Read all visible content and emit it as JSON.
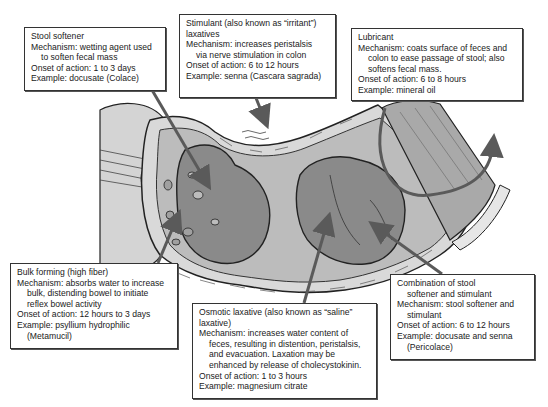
{
  "figure": {
    "colors": {
      "colon_wall": "#d9d9d9",
      "colon_lumen": "#bcbcbc",
      "stool_mass": "#8a8a8a",
      "arrow": "#5a5a5a",
      "box_border": "#333333",
      "box_bg": "#ffffff"
    }
  },
  "callouts": [
    {
      "id": "stool-softener",
      "title": "Stool softener",
      "lines": [
        "Stool softener",
        "Mechanism: wetting agent used",
        "to soften fecal mass",
        "Onset of action: 1 to 3 days",
        "Example: docusate (Colace)"
      ]
    },
    {
      "id": "stimulant",
      "title": "Stimulant (also known as “irritant”) laxatives",
      "lines": [
        "Stimulant (also known as “irritant”)",
        "laxatives",
        "Mechanism: increases peristalsis",
        "via nerve stimulation in colon",
        "Onset of action: 6 to 12 hours",
        "Example: senna (Cascara sagrada)"
      ]
    },
    {
      "id": "lubricant",
      "title": "Lubricant",
      "lines": [
        "Lubricant",
        "Mechanism: coats surface of feces and",
        "colon to ease passage of stool; also",
        "softens fecal mass.",
        "Onset of action: 6 to 8 hours",
        "Example: mineral oil"
      ]
    },
    {
      "id": "bulk-forming",
      "title": "Bulk forming (high fiber)",
      "lines": [
        "Bulk forming (high fiber)",
        "Mechanism: absorbs water to increase",
        "bulk, distending bowel to initiate",
        "reflex bowel activity",
        "Onset of action: 12 hours to 3 days",
        "Example: psyllium hydrophilic",
        "(Metamucil)"
      ]
    },
    {
      "id": "osmotic",
      "title": "Osmotic laxative (also known as “saline” laxative)",
      "lines": [
        "Osmotic laxative (also known as “saline”",
        "laxative)",
        "Mechanism: increases water content of",
        "feces, resulting in distention, peristalsis,",
        "and evacuation. Laxation may be",
        "enhanced by release of cholecystokinin.",
        "Onset of action: 1 to 3 hours",
        "Example: magnesium citrate"
      ]
    },
    {
      "id": "combination",
      "title": "Combination of stool softener and stimulant",
      "lines": [
        "Combination of stool",
        "softener and stimulant",
        "Mechanism: stool softener and",
        "stimulant",
        "Onset of action: 6 to 12 hours",
        "Example: docusate and senna",
        "(Pericolace)"
      ]
    }
  ]
}
